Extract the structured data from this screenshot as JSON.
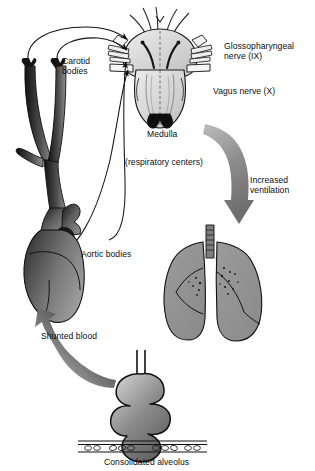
{
  "diagram": {
    "labels": {
      "carotid_bodies": "Carotid\nbodies",
      "glossopharyngeal": "Glossopharyngeal\nnerve (IX)",
      "vagus": "Vagus nerve (X)",
      "medulla": "Medulla",
      "respiratory_centers": "(respiratory centers)",
      "increased_ventilation": "Increased\nventilation",
      "aortic_bodies": "Aortic bodies",
      "shunted_blood": "Shunted blood",
      "consolidated_alveolus": "Consolidated alveolus"
    },
    "structures": [
      {
        "name": "medulla-brainstem",
        "label": "Medulla"
      },
      {
        "name": "carotid-arteries-heart",
        "label": "Aortic bodies"
      },
      {
        "name": "lungs",
        "label": "Increased ventilation"
      },
      {
        "name": "alveolus-cluster",
        "label": "Consolidated alveolus"
      },
      {
        "name": "capillary-bed",
        "label": ""
      }
    ],
    "arrows": [
      {
        "name": "afferent-carotid-left",
        "from": "carotid-body-left",
        "to": "medulla"
      },
      {
        "name": "afferent-carotid-right",
        "from": "carotid-body-right",
        "to": "medulla"
      },
      {
        "name": "afferent-aortic",
        "from": "aortic-bodies",
        "to": "medulla"
      },
      {
        "name": "afferent-lower",
        "from": "aortic-arch",
        "to": "medulla"
      },
      {
        "name": "efferent-ventilation",
        "from": "medulla",
        "to": "lungs"
      },
      {
        "name": "shunted-blood-flow",
        "from": "consolidated-alveolus",
        "to": "heart"
      }
    ],
    "colors": {
      "ink": "#0d0d0d",
      "vessel_dark": "#1a1a1a",
      "vessel_mid": "#6e6e6e",
      "tissue_gray": "#8c8c8c",
      "brain_light": "#d9d9d9",
      "arrow_gray": "#8a8a8a",
      "background": "#ffffff"
    }
  }
}
